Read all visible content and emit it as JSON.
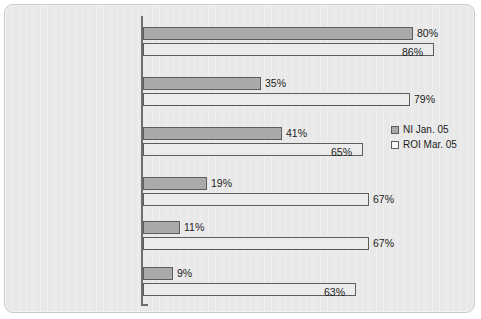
{
  "chart_data": {
    "type": "bar",
    "orientation": "horizontal",
    "title": "",
    "xlabel": "",
    "ylabel": "",
    "xlim": [
      0,
      100
    ],
    "grid": false,
    "legend_position": "middle-right",
    "categories": [
      "Any change",
      "Paid more attention to the road as a pedestrian",
      "Paid more attention to pedestrians when driving",
      "Talked about it with friends & family",
      "Encouraged someone to pay more attention when a pedestrian",
      "Encouraged someone to pay more attention to pedestrians when driving"
    ],
    "category_lines": [
      [
        "Any change"
      ],
      [
        "Paid more attention to",
        "the road as a pedestrian"
      ],
      [
        "Paid more attention to",
        "pedestrians when driving"
      ],
      [
        "Talked about it with",
        "friends & family"
      ],
      [
        "Encouraged someone",
        "to pay more attention",
        "when a pedestrian"
      ],
      [
        "Encouraged someone to",
        "pay more attention to",
        "pedestrians when driving"
      ]
    ],
    "series": [
      {
        "name": "NI Jan. 05",
        "color": "#aaaaaa",
        "values": [
          80,
          35,
          41,
          19,
          11,
          9
        ],
        "labels": [
          "80%",
          "35%",
          "41%",
          "19%",
          "11%",
          "9%"
        ]
      },
      {
        "name": "ROI Mar. 05",
        "color": "#ececec",
        "values": [
          86,
          79,
          65,
          67,
          67,
          63
        ],
        "labels": [
          "86%",
          "79%",
          "65%",
          "67%",
          "67%",
          "63%"
        ]
      }
    ]
  },
  "legend": {
    "items": [
      {
        "label": "NI Jan. 05"
      },
      {
        "label": "ROI Mar. 05"
      }
    ]
  },
  "colors": {
    "series_ni": "#aaaaaa",
    "series_roi": "#ececec",
    "bar_border": "#5d5d5d",
    "axis": "#6e6e6e",
    "background": "#e9e9e9",
    "text": "#1b1b1b"
  }
}
